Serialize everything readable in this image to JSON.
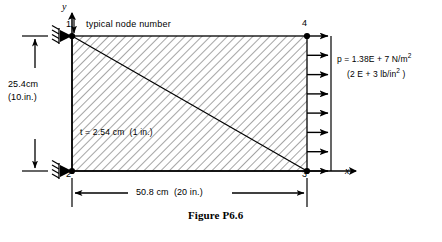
{
  "figure": {
    "caption": "Figure P6.6",
    "annotation_note": "typical node number",
    "axes": {
      "y_label": "y",
      "x_label": "x"
    },
    "nodes": [
      {
        "id": "1",
        "label": "1",
        "position": "top-left"
      },
      {
        "id": "2",
        "label": "2",
        "position": "bottom-left"
      },
      {
        "id": "3",
        "label": "3",
        "position": "bottom-right"
      },
      {
        "id": "4",
        "label": "4",
        "position": "top-right"
      }
    ],
    "dimensions": {
      "height_metric": "25.4cm",
      "height_imperial": "(10.in.)",
      "width_combined": "50.8 cm  (20 in.)"
    },
    "thickness": {
      "text": "t = 2.54 cm  (1 in.)"
    },
    "pressure": {
      "line1_prefix": "p = 1.38E + 7 N/m",
      "line1_exponent": "2",
      "line2_prefix": "(2 E + 3 lb/in",
      "line2_exponent": "2",
      "line2_suffix": " )"
    },
    "supports": {
      "top_left": "pin-support",
      "bottom_left": "pin-support"
    },
    "load_arrow_count": 8,
    "colors": {
      "ink": "#000000",
      "hatch": "#1a1a1a",
      "background": "#ffffff"
    }
  }
}
